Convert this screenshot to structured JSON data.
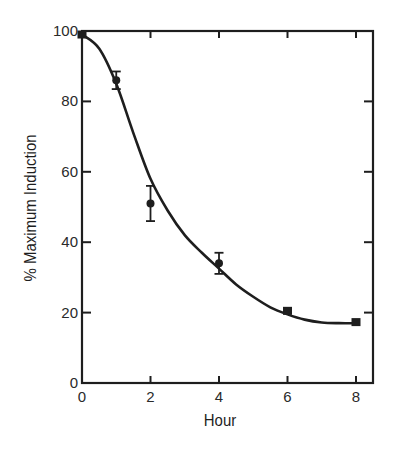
{
  "chart_data": {
    "type": "line",
    "title": "",
    "xlabel": "Hour",
    "ylabel": "% Maximum Induction",
    "xlim": [
      0,
      8.5
    ],
    "ylim": [
      0,
      100
    ],
    "x_ticks": [
      0,
      2,
      4,
      6,
      8
    ],
    "y_ticks": [
      0,
      20,
      40,
      60,
      80,
      100
    ],
    "grid": false,
    "legend": null,
    "series": [
      {
        "name": "measured",
        "style": "markers-with-error-bars",
        "points": [
          {
            "x": 0,
            "y": 99,
            "err": 0,
            "marker": "square"
          },
          {
            "x": 1,
            "y": 86,
            "err": 2.5,
            "marker": "circle"
          },
          {
            "x": 2,
            "y": 51,
            "err": 5,
            "marker": "circle"
          },
          {
            "x": 4,
            "y": 34,
            "err": 3,
            "marker": "circle"
          },
          {
            "x": 6,
            "y": 20.5,
            "err": 0.5,
            "marker": "square"
          },
          {
            "x": 8,
            "y": 17.3,
            "err": 0.5,
            "marker": "square"
          }
        ]
      },
      {
        "name": "fitted curve",
        "style": "smooth-line",
        "x": [
          0,
          0.5,
          1,
          1.5,
          2,
          2.5,
          3,
          3.5,
          4,
          4.5,
          5,
          5.5,
          6,
          6.5,
          7,
          7.5,
          8
        ],
        "y": [
          99,
          95,
          85,
          71,
          58,
          49,
          42,
          37,
          32.5,
          28,
          24.5,
          21.5,
          19.5,
          18,
          17.2,
          17,
          17
        ]
      }
    ]
  },
  "axes": {
    "x_tick_labels": [
      "0",
      "2",
      "4",
      "6",
      "8"
    ],
    "y_tick_labels": [
      "0",
      "20",
      "40",
      "60",
      "80",
      "100"
    ],
    "x_title": "Hour",
    "y_title": "% Maximum Induction"
  },
  "colors": {
    "ink": "#1e1e1e",
    "background": "#ffffff"
  }
}
